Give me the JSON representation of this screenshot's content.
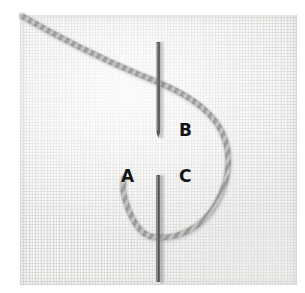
{
  "image": {
    "subject": "embroidery-stitch-demonstration-photo",
    "description": "Close-up photograph of a sewing needle piercing pale woven linen fabric with a grey twisted thread forming a loop, used to demonstrate a detached chain / lazy-daisy style stitch.",
    "width": 305,
    "height": 293
  },
  "canvas": {
    "background_color": "#ffffff",
    "fabric": {
      "name": "linen-fabric",
      "color": "#f3f3f1",
      "weave_color": "#cacac8",
      "left": 20,
      "top": 15,
      "width": 277,
      "height": 270
    }
  },
  "needle": {
    "name": "sewing-needle",
    "color": "#4a4a4c",
    "highlight_color": "#9b9b9d",
    "x": 158,
    "upper_segment": {
      "y_top": 42,
      "y_bottom": 138
    },
    "lower_segment": {
      "y_top": 175,
      "y_bottom": 282
    },
    "width": 4
  },
  "thread": {
    "name": "twisted-embroidery-thread",
    "color": "#9a9a98",
    "shadow_color": "#7d7d7b",
    "highlight_color": "#d2d2d0",
    "width": 5,
    "style": "twisted-cord",
    "path_description": "Enters upper-left of fabric, runs diagonally down-right across the needle, sweeps into a wide loop to the right, curves down and back left under the needle, and terminates at point A."
  },
  "labels": [
    {
      "id": "label-a",
      "text": "A",
      "x": 121,
      "y": 168,
      "meaning": "thread-emerges-point"
    },
    {
      "id": "label-b",
      "text": "B",
      "x": 179,
      "y": 122,
      "meaning": "needle-entry-point"
    },
    {
      "id": "label-c",
      "text": "C",
      "x": 179,
      "y": 168,
      "meaning": "needle-exit-point"
    }
  ],
  "label_text": {
    "a": "A",
    "b": "B",
    "c": "C"
  }
}
